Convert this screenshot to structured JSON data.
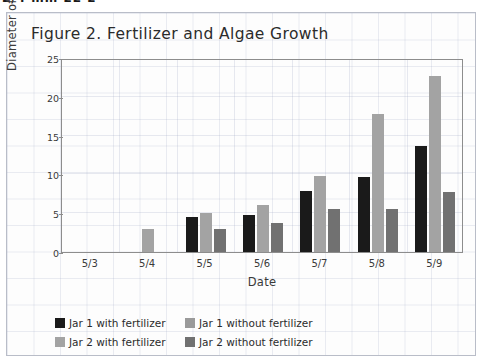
{
  "top_strip": {
    "cut_text": "2/4 mm 22 2"
  },
  "chart_data": {
    "type": "bar",
    "title": "Figure 2. Fertilizer and Algae Growth",
    "xlabel": "Date",
    "ylabel": "Diameter of algae (mm)",
    "categories": [
      "5/3",
      "5/4",
      "5/5",
      "5/6",
      "5/7",
      "5/8",
      "5/9"
    ],
    "ylim": [
      0,
      25
    ],
    "yticks": [
      0,
      5,
      10,
      15,
      20,
      25
    ],
    "grid": true,
    "legend_position": "bottom-left",
    "series": [
      {
        "name": "Jar 1 with fertilizer",
        "color": "#1a1a1a",
        "values": [
          0,
          0,
          4.5,
          4.8,
          7.8,
          9.7,
          13.6
        ]
      },
      {
        "name": "Jar 1 without fertilizer",
        "color": "#9a9a9a",
        "values": [
          0,
          0,
          0,
          0,
          0,
          0,
          0
        ]
      },
      {
        "name": "Jar 2 with fertilizer",
        "color": "#a3a3a3",
        "values": [
          0,
          3.0,
          5.0,
          6.0,
          9.8,
          17.8,
          22.7
        ]
      },
      {
        "name": "Jar 2 without fertilizer",
        "color": "#717171",
        "values": [
          0,
          0,
          3.0,
          3.8,
          5.6,
          5.6,
          7.7
        ]
      }
    ]
  },
  "legend": [
    {
      "label": "Jar 1 with fertilizer",
      "color": "#1a1a1a"
    },
    {
      "label": "Jar 1 without fertilizer",
      "color": "#9a9a9a"
    },
    {
      "label": "Jar 2 with fertilizer",
      "color": "#a3a3a3"
    },
    {
      "label": "Jar 2 without fertilizer",
      "color": "#717171"
    }
  ]
}
